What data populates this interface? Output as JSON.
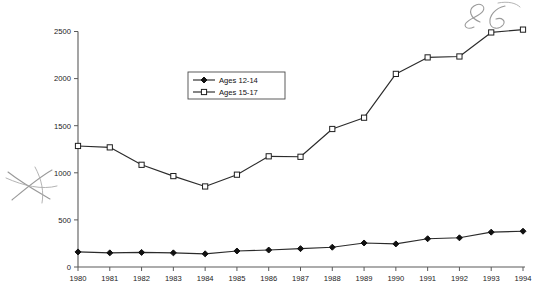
{
  "chart_data": {
    "type": "line",
    "title": "",
    "subtitle": "",
    "xlabel": "",
    "ylabel": "",
    "x": [
      1980,
      1981,
      1982,
      1983,
      1984,
      1985,
      1986,
      1987,
      1988,
      1989,
      1990,
      1991,
      1992,
      1993,
      1994
    ],
    "categories": [
      "1980",
      "1981",
      "1982",
      "1983",
      "1984",
      "1985",
      "1986",
      "1987",
      "1988",
      "1989",
      "1990",
      "1991",
      "1992",
      "1993",
      "1994"
    ],
    "series": [
      {
        "name": "Ages 12-14",
        "marker": "filled-diamond",
        "values": [
          160,
          150,
          155,
          150,
          140,
          170,
          180,
          195,
          210,
          255,
          245,
          300,
          310,
          370,
          380
        ]
      },
      {
        "name": "Ages 15-17",
        "marker": "open-square",
        "values": [
          1285,
          1270,
          1085,
          965,
          855,
          980,
          1175,
          1170,
          1465,
          1585,
          2050,
          2225,
          2235,
          2490,
          2520
        ]
      }
    ],
    "ylim": [
      0,
      2500
    ],
    "yticks": [
      0,
      500,
      1000,
      1500,
      2000,
      2500
    ],
    "ytick_labels": [
      "0",
      "500",
      "1000",
      "1500",
      "2000",
      "2500"
    ],
    "xlim": [
      1980,
      1994
    ],
    "grid": false,
    "legend_position": "upper-center-left"
  },
  "legend": {
    "entries": [
      {
        "label": "Ages 12-14"
      },
      {
        "label": "Ages 15-17"
      }
    ]
  },
  "annotations": [
    {
      "name": "handwritten-mark-top-right",
      "text": "86"
    },
    {
      "name": "pencil-x-mark-left",
      "text": ""
    }
  ],
  "colors": {
    "line": "#2b2b2b",
    "axis": "#5a5a5a",
    "text": "#1a1a1a",
    "marker_fill": "#ffffff",
    "annotation": "#9a9a9a"
  }
}
